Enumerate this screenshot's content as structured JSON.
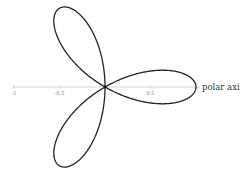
{
  "diagram": {
    "axis_label": "polar axis",
    "ticks": [
      {
        "value": -1,
        "label": "-1"
      },
      {
        "value": -0.5,
        "label": "-0.5"
      },
      {
        "value": 0.5,
        "label": "0.5"
      }
    ],
    "curve": {
      "equation": "r = cos(3θ)",
      "petals": 3,
      "color": "#222222"
    },
    "axis_color": "#bbbbbb"
  },
  "chart_data": {
    "type": "line",
    "title": "",
    "xlabel": "polar axis",
    "ylabel": "",
    "xlim": [
      -1,
      1
    ],
    "tick_labels": [
      "-1",
      "-0.5",
      "0.5"
    ],
    "series": [
      {
        "name": "r = cos(3θ)",
        "kind": "polar rose",
        "petals": 3,
        "petal_tips_deg": [
          0,
          120,
          240
        ],
        "max_r": 1
      }
    ],
    "grid": false,
    "legend": "none"
  }
}
